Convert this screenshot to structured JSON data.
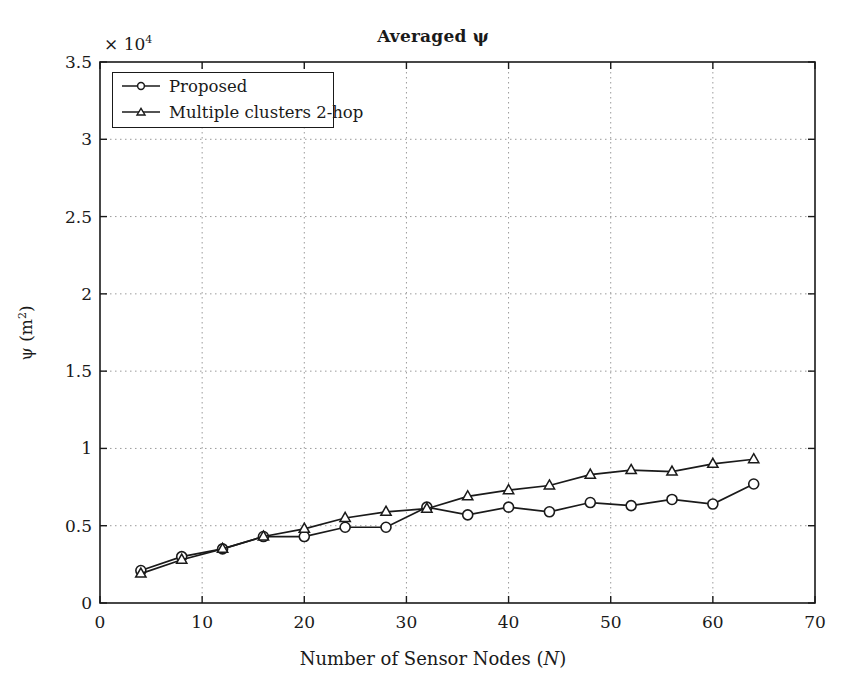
{
  "chart_data": {
    "type": "line",
    "title": "Averaged ψ",
    "xlabel": "Number of Sensor Nodes (N)",
    "ylabel": "ψ (m²)",
    "y_multiplier_text": "× 10",
    "y_multiplier_exponent": "4",
    "y_multiplier_value": 10000,
    "xlim": [
      0,
      70
    ],
    "ylim": [
      0,
      3.5
    ],
    "xticks": [
      0,
      10,
      20,
      30,
      40,
      50,
      60,
      70
    ],
    "xtick_labels": [
      "0",
      "10",
      "20",
      "30",
      "40",
      "50",
      "60",
      "70"
    ],
    "yticks": [
      0,
      0.5,
      1,
      1.5,
      2,
      2.5,
      3,
      3.5
    ],
    "ytick_labels": [
      "0",
      "0.5",
      "1",
      "1.5",
      "2",
      "2.5",
      "3",
      "3.5"
    ],
    "grid": true,
    "grid_style": "dotted",
    "legend_position": "upper-left",
    "x": [
      4,
      8,
      12,
      16,
      20,
      24,
      28,
      32,
      36,
      40,
      44,
      48,
      52,
      56,
      60,
      64
    ],
    "series": [
      {
        "name": "Proposed",
        "marker": "circle",
        "color": "#1a1a1a",
        "values": [
          0.21,
          0.3,
          0.35,
          0.43,
          0.43,
          0.49,
          0.49,
          0.62,
          0.57,
          0.62,
          0.59,
          0.65,
          0.63,
          0.67,
          0.64,
          0.77
        ]
      },
      {
        "name": "Multiple clusters 2-hop",
        "marker": "triangle",
        "color": "#1a1a1a",
        "values": [
          0.19,
          0.28,
          0.35,
          0.43,
          0.48,
          0.55,
          0.59,
          0.61,
          0.69,
          0.73,
          0.76,
          0.83,
          0.86,
          0.85,
          0.9,
          0.93
        ]
      }
    ]
  },
  "legend": {
    "entries": [
      {
        "label": "Proposed",
        "marker": "circle"
      },
      {
        "label": "Multiple clusters 2-hop",
        "marker": "triangle"
      }
    ]
  },
  "colors": {
    "axis": "#1a1a1a",
    "grid": "#9a9a9a",
    "line": "#1a1a1a",
    "background": "#ffffff"
  }
}
